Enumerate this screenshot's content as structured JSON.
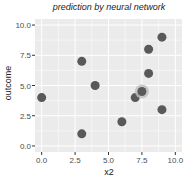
{
  "chart_data": {
    "type": "scatter",
    "title": "prediction by neural network",
    "xlabel": "x2",
    "ylabel": "outcome",
    "xlim": [
      -0.5,
      10.5
    ],
    "ylim": [
      -0.5,
      10.5
    ],
    "x_ticks": [
      "0.0",
      "2.5",
      "5.0",
      "7.5",
      "10.0"
    ],
    "y_ticks": [
      "0.0",
      "2.5",
      "5.0",
      "7.5",
      "10.0"
    ],
    "grid": true,
    "points": [
      {
        "x": 0,
        "y": 4
      },
      {
        "x": 3,
        "y": 7
      },
      {
        "x": 3,
        "y": 1
      },
      {
        "x": 4,
        "y": 5
      },
      {
        "x": 6,
        "y": 2
      },
      {
        "x": 7,
        "y": 4
      },
      {
        "x": 8,
        "y": 6
      },
      {
        "x": 8,
        "y": 8
      },
      {
        "x": 9,
        "y": 9
      },
      {
        "x": 9,
        "y": 3
      }
    ],
    "highlighted_point": {
      "x": 7.5,
      "y": 4.5
    },
    "colors": {
      "panel": "#ebebeb",
      "grid": "#ffffff",
      "point": "#595959",
      "highlight_halo": "#bdbdbd"
    }
  }
}
